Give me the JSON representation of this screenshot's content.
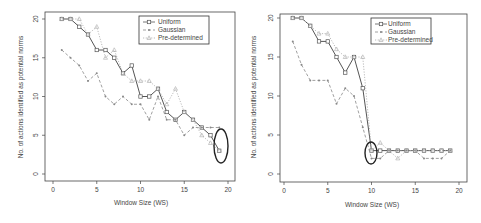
{
  "chart_data": [
    {
      "type": "line",
      "title": "",
      "xlabel": "Window Size (WS)",
      "ylabel": "No. of actions identified as potential norms",
      "x": [
        1,
        2,
        3,
        4,
        5,
        6,
        7,
        8,
        9,
        10,
        11,
        12,
        13,
        14,
        15,
        16,
        17,
        18,
        19
      ],
      "xlim": [
        0,
        20
      ],
      "ylim": [
        0,
        20
      ],
      "xticks": [
        0,
        5,
        10,
        15,
        20
      ],
      "yticks": [
        0,
        5,
        10,
        15,
        20
      ],
      "grid": false,
      "legend_position": "top-right",
      "series": [
        {
          "name": "Uniform",
          "marker": "square",
          "line": "solid",
          "color": "#555555",
          "values": [
            20,
            20,
            19,
            18,
            16,
            16,
            15,
            13,
            14,
            10,
            10,
            11,
            8,
            7,
            8,
            7,
            6,
            5,
            3
          ]
        },
        {
          "name": "Gaussian",
          "marker": "star",
          "line": "dashed",
          "color": "#888888",
          "values": [
            16,
            15,
            14,
            12,
            13,
            10,
            9,
            10,
            9,
            9,
            7,
            10,
            7,
            7,
            5,
            6,
            6,
            6,
            6
          ]
        },
        {
          "name": "Pre-determined",
          "marker": "triangle",
          "line": "dotted",
          "color": "#aaaaaa",
          "values": [
            20,
            20,
            20,
            18,
            19,
            15,
            16,
            13,
            12,
            12,
            12,
            11,
            9,
            11,
            8,
            7,
            5,
            4,
            3
          ]
        }
      ],
      "annotations": [
        {
          "type": "ellipse",
          "x": 19,
          "y": 4.5,
          "note": "highlighted convergence region"
        }
      ]
    },
    {
      "type": "line",
      "title": "",
      "xlabel": "Window Size (WS)",
      "ylabel": "No. of actions identified as potential norms",
      "x": [
        1,
        2,
        3,
        4,
        5,
        6,
        7,
        8,
        9,
        10,
        11,
        12,
        13,
        14,
        15,
        16,
        17,
        18,
        19
      ],
      "xlim": [
        0,
        20
      ],
      "ylim": [
        0,
        20
      ],
      "xticks": [
        0,
        5,
        10,
        15,
        20
      ],
      "yticks": [
        0,
        5,
        10,
        15,
        20
      ],
      "grid": false,
      "legend_position": "top-right",
      "series": [
        {
          "name": "Uniform",
          "marker": "square",
          "line": "solid",
          "color": "#555555",
          "values": [
            20,
            20,
            19,
            17,
            17,
            15,
            13,
            15,
            11,
            3,
            3,
            3,
            3,
            3,
            3,
            3,
            3,
            3,
            3
          ]
        },
        {
          "name": "Gaussian",
          "marker": "star",
          "line": "dashed",
          "color": "#888888",
          "values": [
            17,
            14,
            12,
            12,
            12,
            9,
            11,
            10,
            6,
            2,
            2,
            3,
            3,
            3,
            3,
            2,
            2,
            2,
            3
          ]
        },
        {
          "name": "Pre-determined",
          "marker": "triangle",
          "line": "dotted",
          "color": "#aaaaaa",
          "values": [
            20,
            20,
            19,
            18,
            18,
            16,
            15,
            15,
            15,
            3,
            4,
            3,
            2,
            3,
            3,
            3,
            3,
            3,
            3
          ]
        }
      ],
      "annotations": [
        {
          "type": "ellipse",
          "x": 10,
          "y": 3,
          "note": "highlighted convergence region"
        }
      ]
    }
  ],
  "charts": [
    {
      "xlabel": "Window Size (WS)",
      "ylabel": "No. of actions identified as potential norms",
      "legend": [
        "Uniform",
        "Gaussian",
        "Pre-determined"
      ]
    },
    {
      "xlabel": "Window Size (WS)",
      "ylabel": "No. of actions identified as potential norms",
      "legend": [
        "Uniform",
        "Gaussian",
        "Pre-determined"
      ]
    }
  ]
}
